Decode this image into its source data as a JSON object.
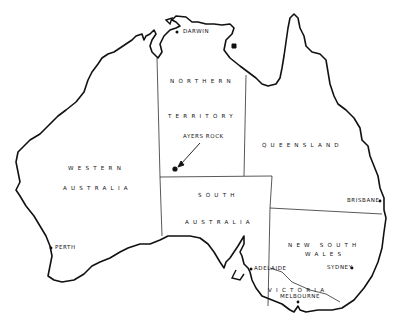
{
  "map": {
    "title": "Australia",
    "regions": {
      "northern_territory_1": "NORTHERN",
      "northern_territory_2": "TERRITORY",
      "western_australia_1": "WESTERN",
      "western_australia_2": "AUSTRALIA",
      "queensland": "QUEENSLAND",
      "south_australia_1": "SOUTH",
      "south_australia_2": "AUSTRALIA",
      "new_south_wales_1": "NEW SOUTH",
      "new_south_wales_2": "WALES",
      "victoria": "VICTORIA"
    },
    "cities": {
      "darwin": "DARWIN",
      "perth": "PERTH",
      "brisbane": "BRISBANE",
      "sydney": "SYDNEY",
      "adelaide": "ADELAIDE",
      "melbourne": "MELBOURNE"
    },
    "landmark": "AYERS ROCK",
    "colors": {
      "line": "#111111",
      "background": "#ffffff"
    }
  }
}
